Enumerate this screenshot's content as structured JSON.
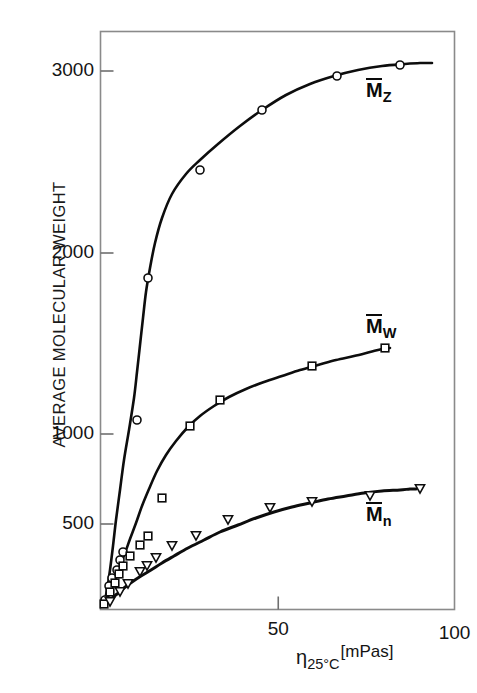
{
  "chart_data": {
    "type": "line",
    "title": "",
    "xlabel": "η 25°C [mPas]",
    "ylabel": "AVERAGE MOLECULAR WEIGHT",
    "xlim": [
      0,
      100
    ],
    "ylim": [
      150,
      3300
    ],
    "yscale": "log-like",
    "grid": false,
    "legend_position": "inline-right",
    "x_ticks": [
      50,
      100
    ],
    "x_tick_labels": [
      "50",
      "100"
    ],
    "y_ticks": [
      500,
      1000,
      2000,
      3000
    ],
    "y_tick_labels": [
      "500",
      "1000",
      "2000",
      "3000"
    ],
    "series": [
      {
        "name": "Mz",
        "label_base": "M",
        "label_sub": "Z",
        "marker": "circle-open",
        "points": [
          {
            "x": 1.5,
            "y": 200
          },
          {
            "x": 2.2,
            "y": 235
          },
          {
            "x": 2.8,
            "y": 255
          },
          {
            "x": 3.4,
            "y": 290
          },
          {
            "x": 5.0,
            "y": 340
          },
          {
            "x": 6.5,
            "y": 1060
          },
          {
            "x": 10.5,
            "y": 1840
          },
          {
            "x": 16.5,
            "y": 2430
          },
          {
            "x": 31.0,
            "y": 2880
          },
          {
            "x": 58.5,
            "y": 2960
          },
          {
            "x": 83.0,
            "y": 3010
          }
        ]
      },
      {
        "name": "Mw",
        "label_base": "M",
        "label_sub": "W",
        "marker": "square-open",
        "points": [
          {
            "x": 1.5,
            "y": 195
          },
          {
            "x": 2.6,
            "y": 225
          },
          {
            "x": 3.5,
            "y": 245
          },
          {
            "x": 5.0,
            "y": 268
          },
          {
            "x": 7.0,
            "y": 400
          },
          {
            "x": 11.0,
            "y": 820
          },
          {
            "x": 17.5,
            "y": 990
          },
          {
            "x": 31.0,
            "y": 1210
          },
          {
            "x": 58.5,
            "y": 1390
          },
          {
            "x": 83.0,
            "y": 1470
          }
        ]
      },
      {
        "name": "Mn",
        "label_base": "M",
        "label_sub": "n",
        "marker": "triangle-down-open",
        "points": [
          {
            "x": 2.0,
            "y": 180
          },
          {
            "x": 3.6,
            "y": 195
          },
          {
            "x": 5.2,
            "y": 245
          },
          {
            "x": 8.0,
            "y": 280
          },
          {
            "x": 12.0,
            "y": 400
          },
          {
            "x": 18.5,
            "y": 415
          },
          {
            "x": 31.0,
            "y": 420
          },
          {
            "x": 58.5,
            "y": 455
          },
          {
            "x": 83.0,
            "y": 465
          }
        ]
      }
    ]
  },
  "axes": {
    "y_title": "AVERAGE MOLECULAR WEIGHT",
    "y_tick_labels": [
      "3000",
      "2000",
      "1000",
      "500"
    ],
    "x_tick_labels": [
      "50",
      "100"
    ],
    "x_title_symbol": "η",
    "x_title_sub": "25°C",
    "x_title_unit": "[mPas]"
  },
  "series_labels": [
    {
      "base": "M",
      "sub": "Z"
    },
    {
      "base": "M",
      "sub": "W"
    },
    {
      "base": "M",
      "sub": "n"
    }
  ],
  "colors": {
    "ink": "#111111",
    "frame": "#808080",
    "background": "#ffffff"
  }
}
